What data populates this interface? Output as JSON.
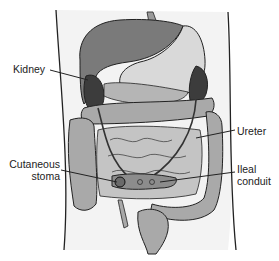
{
  "figure": {
    "colors": {
      "background": "#ffffff",
      "body_fill": "#f2f2f2",
      "organ_light": "#bdbdbd",
      "organ_mid": "#a8a8a8",
      "organ_dark": "#6e6e6e",
      "kidney_dark": "#3a3a3a",
      "outline": "#222222"
    }
  },
  "labels": {
    "kidney": "Kidney",
    "ureter": "Ureter",
    "cutaneous_stoma_line1": "Cutaneous",
    "cutaneous_stoma_line2": "stoma",
    "ileal_conduit_line1": "Ileal",
    "ileal_conduit_line2": "conduit"
  }
}
